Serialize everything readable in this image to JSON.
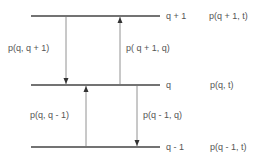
{
  "diagram": {
    "levels": [
      {
        "state": "q + 1",
        "prob": "p(q + 1, t)"
      },
      {
        "state": "q",
        "prob": "p(q, t)"
      },
      {
        "state": "q - 1",
        "prob": "p(q - 1, t)"
      }
    ],
    "transitions": [
      {
        "label": "p(q, q + 1)",
        "direction": "down",
        "from": "q + 1",
        "to": "q"
      },
      {
        "label": "p( q + 1, q)",
        "direction": "up",
        "from": "q",
        "to": "q + 1"
      },
      {
        "label": "p(q, q - 1)",
        "direction": "up",
        "from": "q - 1",
        "to": "q"
      },
      {
        "label": "p(q - 1, q)",
        "direction": "down",
        "from": "q",
        "to": "q - 1"
      }
    ],
    "colors": {
      "line": "#444444",
      "arrow": "#666666",
      "text": "#555555"
    }
  }
}
